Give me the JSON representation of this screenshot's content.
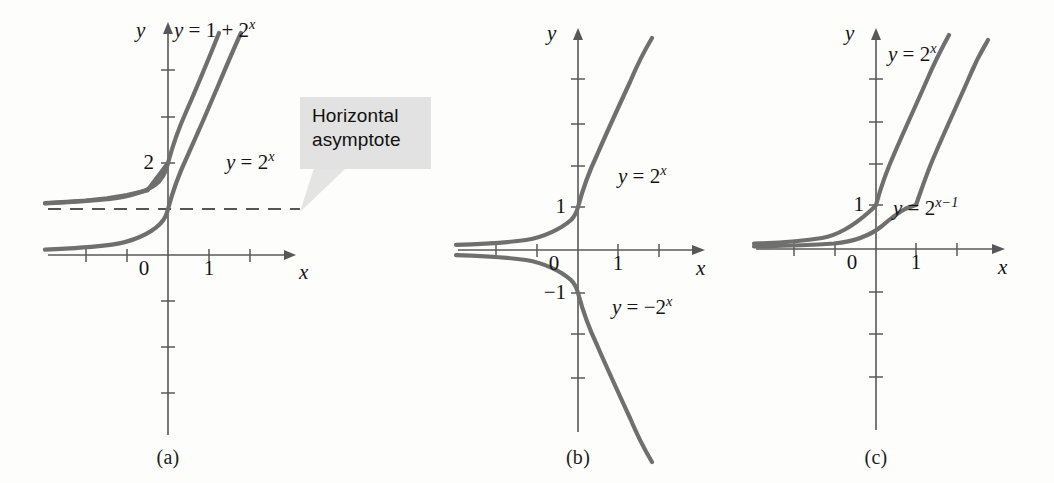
{
  "figure": {
    "background_color": "#fdfdfc",
    "curve_color": "#6f6f6f",
    "axis_color": "#58585a",
    "callout_bg": "#e2e2e2"
  },
  "panels": [
    {
      "id": "a",
      "caption": "(a)",
      "axis": {
        "x_label": "x",
        "y_label": "y"
      },
      "tick_labels": {
        "x": [
          "0",
          "1"
        ],
        "y": [
          "2"
        ]
      },
      "curve_labels": [
        {
          "name": "curve-label-one-plus-two-pow-x",
          "html": "<i>y</i> = 1 + 2<sup>x</sup>"
        },
        {
          "name": "curve-label-two-pow-x",
          "html": "<i>y</i> = 2<sup>x</sup>"
        }
      ],
      "callout": {
        "line1": "Horizontal",
        "line2": "asymptote"
      }
    },
    {
      "id": "b",
      "caption": "(b)",
      "axis": {
        "x_label": "x",
        "y_label": "y"
      },
      "tick_labels": {
        "x": [
          "0",
          "1"
        ],
        "y": [
          "1",
          "−1"
        ]
      },
      "curve_labels": [
        {
          "name": "curve-label-two-pow-x",
          "html": "<i>y</i> = 2<sup>x</sup>"
        },
        {
          "name": "curve-label-neg-two-pow-x",
          "html": "<i>y</i> = −2<sup>x</sup>"
        }
      ]
    },
    {
      "id": "c",
      "caption": "(c)",
      "axis": {
        "x_label": "x",
        "y_label": "y"
      },
      "tick_labels": {
        "x": [
          "0",
          "1"
        ],
        "y": [
          "1"
        ]
      },
      "curve_labels": [
        {
          "name": "curve-label-two-pow-x",
          "html": "<i>y</i> = 2<sup>x</sup>"
        },
        {
          "name": "curve-label-two-pow-x-minus-1",
          "html": "<i>y</i> = 2<sup>x−1</sup>"
        }
      ]
    }
  ],
  "chart_data": {
    "type": "line",
    "title": "",
    "subplots": [
      {
        "id": "a",
        "caption": "(a)",
        "xlabel": "x",
        "ylabel": "y",
        "xlim": [
          -3,
          3
        ],
        "ylim": [
          -5,
          5
        ],
        "xticks": [
          -3,
          -2,
          -1,
          0,
          1,
          2
        ],
        "yticks": [
          -4,
          -3,
          -2,
          -1,
          1,
          2,
          3,
          4
        ],
        "xtick_labels_shown": {
          "0": "0",
          "1": "1"
        },
        "ytick_labels_shown": {
          "2": "2"
        },
        "grid": false,
        "series": [
          {
            "name": "y = 1 + 2^x",
            "expression": "1 + 2^x",
            "x": [
              -3,
              -2.5,
              -2,
              -1.5,
              -1,
              -0.5,
              0,
              0.5,
              1,
              1.5,
              1.9
            ],
            "y": [
              1.125,
              1.177,
              1.25,
              1.354,
              1.5,
              1.707,
              2,
              2.414,
              3,
              3.828,
              4.73
            ],
            "color": "#6f6f6f"
          },
          {
            "name": "y = 2^x",
            "expression": "2^x",
            "x": [
              -3,
              -2.5,
              -2,
              -1.5,
              -1,
              -0.5,
              0,
              0.5,
              1,
              1.5,
              2,
              2.25
            ],
            "y": [
              0.125,
              0.177,
              0.25,
              0.354,
              0.5,
              0.707,
              1,
              1.414,
              2,
              2.828,
              4,
              4.76
            ],
            "color": "#6f6f6f"
          }
        ],
        "annotations": [
          {
            "type": "horizontal-asymptote",
            "label": "Horizontal asymptote",
            "y": 1,
            "style": "dashed",
            "color": "#555555"
          }
        ]
      },
      {
        "id": "b",
        "caption": "(b)",
        "xlabel": "x",
        "ylabel": "y",
        "xlim": [
          -3,
          3
        ],
        "ylim": [
          -5,
          5
        ],
        "xticks": [
          -3,
          -2,
          -1,
          0,
          1,
          2
        ],
        "yticks": [
          -4,
          -3,
          -2,
          -1,
          1,
          2,
          3,
          4
        ],
        "xtick_labels_shown": {
          "0": "0",
          "1": "1"
        },
        "ytick_labels_shown": {
          "1": "1",
          "-1": "−1"
        },
        "grid": false,
        "series": [
          {
            "name": "y = 2^x",
            "expression": "2^x",
            "x": [
              -3,
              -2.5,
              -2,
              -1.5,
              -1,
              -0.5,
              0,
              0.5,
              1,
              1.5,
              2,
              2.25
            ],
            "y": [
              0.125,
              0.177,
              0.25,
              0.354,
              0.5,
              0.707,
              1,
              1.414,
              2,
              2.828,
              4,
              4.76
            ],
            "color": "#6f6f6f"
          },
          {
            "name": "y = -2^x",
            "expression": "-2^x",
            "x": [
              -3,
              -2.5,
              -2,
              -1.5,
              -1,
              -0.5,
              0,
              0.5,
              1,
              1.5,
              2,
              2.25
            ],
            "y": [
              -0.125,
              -0.177,
              -0.25,
              -0.354,
              -0.5,
              -0.707,
              -1,
              -1.414,
              -2,
              -2.828,
              -4,
              -4.76
            ],
            "color": "#6f6f6f"
          }
        ],
        "annotations": []
      },
      {
        "id": "c",
        "caption": "(c)",
        "xlabel": "x",
        "ylabel": "y",
        "xlim": [
          -3,
          3
        ],
        "ylim": [
          -5,
          5
        ],
        "xticks": [
          -3,
          -2,
          -1,
          0,
          1,
          2
        ],
        "yticks": [
          -4,
          -3,
          -2,
          -1,
          1,
          2,
          3,
          4
        ],
        "xtick_labels_shown": {
          "0": "0",
          "1": "1"
        },
        "ytick_labels_shown": {
          "1": "1"
        },
        "grid": false,
        "series": [
          {
            "name": "y = 2^x",
            "expression": "2^x",
            "x": [
              -3,
              -2.5,
              -2,
              -1.5,
              -1,
              -0.5,
              0,
              0.5,
              1,
              1.5,
              2,
              2.2
            ],
            "y": [
              0.125,
              0.177,
              0.25,
              0.354,
              0.5,
              0.707,
              1,
              1.414,
              2,
              2.828,
              4,
              4.59
            ],
            "color": "#6f6f6f"
          },
          {
            "name": "y = 2^(x-1)",
            "expression": "2^(x-1)",
            "x": [
              -3,
              -2.5,
              -2,
              -1.5,
              -1,
              -0.5,
              0,
              0.5,
              1,
              1.5,
              2,
              2.5,
              2.8
            ],
            "y": [
              0.0625,
              0.088,
              0.125,
              0.177,
              0.25,
              0.354,
              0.5,
              0.707,
              1,
              1.414,
              2,
              2.828,
              3.48
            ],
            "color": "#6f6f6f"
          }
        ],
        "annotations": []
      }
    ]
  }
}
